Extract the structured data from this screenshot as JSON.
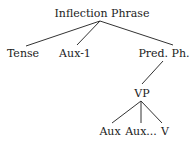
{
  "diagram": {
    "type": "syntax-tree",
    "nodes": {
      "root": "Inflection Phrase",
      "tense": "Tense",
      "aux1": "Aux-1",
      "pred": "Pred. Ph.",
      "vp": "VP",
      "aux": "Aux",
      "auxdots": "Aux...",
      "v": "V"
    },
    "edges": [
      [
        "Inflection Phrase",
        "Tense"
      ],
      [
        "Inflection Phrase",
        "Aux-1"
      ],
      [
        "Inflection Phrase",
        "Pred. Ph."
      ],
      [
        "Pred. Ph.",
        "VP"
      ],
      [
        "VP",
        "Aux"
      ],
      [
        "VP",
        "Aux..."
      ],
      [
        "VP",
        "V"
      ]
    ],
    "line_color": "#333333"
  }
}
